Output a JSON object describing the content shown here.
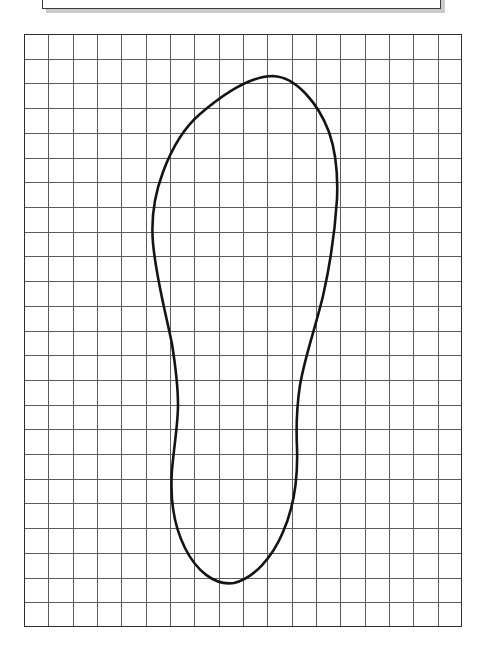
{
  "page": {
    "background_color": "#ffffff",
    "width": 485,
    "height": 666
  },
  "top_panel": {
    "label": "scanned page header strip",
    "x": 42,
    "y": -26,
    "width": 399,
    "height": 35,
    "border_color": "#3b3b3b",
    "shadow_color": "#b9b9b9",
    "fill_color": "#ffffff",
    "note": "clipped by the top image edge; only the lower border and its drop shadow are visible"
  },
  "grid": {
    "label": "graph paper grid",
    "x": 24,
    "y": 34,
    "width": 438,
    "height": 593,
    "columns": 18,
    "rows": 24,
    "cell_width": 24.33,
    "cell_height": 24.71,
    "line_color": "#5c5c5c",
    "border_color": "#2e2e2e",
    "fill_color": "#ffffff"
  },
  "chart_data": {
    "type": "line",
    "subtitle": "",
    "xlabel": "",
    "ylabel": "",
    "grid": true,
    "legend": false,
    "axis_units": "grid squares",
    "xlim": [
      0,
      18
    ],
    "ylim": [
      0,
      24
    ],
    "series": [
      {
        "name": "foot-outline",
        "closed": true,
        "stroke_color": "#141414",
        "stroke_width": 2.6,
        "description": "Closed contour of a right foot: broad toe/ball region at the top, concave medial arch on the left, lateral edge sweeping inward on the right, rounded heel at the bottom.",
        "landmarks": [
          {
            "name": "toe-apex",
            "x_px": 273,
            "y_px": 76,
            "x_cell": 10.2,
            "y_cell": 1.7
          },
          {
            "name": "lateral-ball-widest",
            "x_px": 337,
            "y_px": 200,
            "x_cell": 12.9,
            "y_cell": 6.7
          },
          {
            "name": "lateral-arch-inward",
            "x_px": 300,
            "y_px": 385,
            "x_cell": 11.3,
            "y_cell": 14.2
          },
          {
            "name": "lateral-heel",
            "x_px": 297,
            "y_px": 470,
            "x_cell": 11.2,
            "y_cell": 17.6
          },
          {
            "name": "heel-bottom",
            "x_px": 232,
            "y_px": 583,
            "x_cell": 8.5,
            "y_cell": 22.2
          },
          {
            "name": "medial-heel",
            "x_px": 174,
            "y_px": 478,
            "x_cell": 6.2,
            "y_cell": 18.0
          },
          {
            "name": "medial-arch",
            "x_px": 178,
            "y_px": 405,
            "x_cell": 6.3,
            "y_cell": 15.0
          },
          {
            "name": "medial-ball-widest",
            "x_px": 152,
            "y_px": 232,
            "x_cell": 5.3,
            "y_cell": 8.0
          },
          {
            "name": "medial-toe-shoulder",
            "x_px": 198,
            "y_px": 117,
            "x_cell": 7.1,
            "y_cell": 3.4
          }
        ],
        "path_d": "M 273 76 C 296 77 318 103 329 132 C 336 152 338 176 337 199 C 335 232 330 265 323 296 C 315 329 305 356 300 385 C 297 405 296 427 297 448 C 298 478 294 507 283 532 C 272 558 254 578 234 583 C 214 586 196 570 185 548 C 173 524 170 497 172 470 C 174 446 178 424 178 405 C 178 383 175 363 172 344 C 165 310 156 277 153 243 C 151 220 154 196 163 172 C 173 145 186 126 200 114 C 221 96 249 76 273 76 Z"
      }
    ]
  },
  "elements": {
    "grid_name": "graph-paper-grid",
    "outline_name": "foot-outline-path",
    "panel_name": "top-header-panel"
  }
}
